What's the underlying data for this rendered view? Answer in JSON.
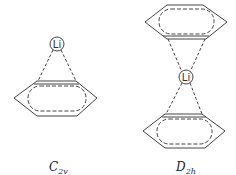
{
  "diagram": {
    "structures": [
      {
        "id": "c2v",
        "symmetry_main": "C",
        "symmetry_sub": "2v",
        "atom": "Li",
        "rings": 1
      },
      {
        "id": "d2h",
        "symmetry_main": "D",
        "symmetry_sub": "2h",
        "atom": "Li",
        "rings": 2
      }
    ]
  },
  "colors": {
    "stroke": "#333333",
    "background": "#ffffff"
  }
}
